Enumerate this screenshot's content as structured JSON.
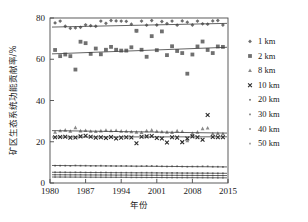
{
  "chart_data": {
    "type": "scatter",
    "title": "",
    "xlabel": "年份",
    "ylabel": "矿区生态系统功能贡献率/%",
    "xlim": [
      1980,
      2015
    ],
    "ylim": [
      0,
      80
    ],
    "grid": false,
    "legend_position": "right",
    "xticks": [
      1980,
      1987,
      1994,
      2001,
      2008,
      2015
    ],
    "yticks": [
      0,
      20,
      40,
      60,
      80
    ],
    "x": [
      1981,
      1982,
      1983,
      1984,
      1985,
      1986,
      1987,
      1988,
      1989,
      1990,
      1991,
      1992,
      1993,
      1994,
      1995,
      1996,
      1997,
      1998,
      1999,
      2000,
      2001,
      2002,
      2003,
      2004,
      2005,
      2006,
      2007,
      2008,
      2009,
      2010,
      2011,
      2012,
      2013,
      2014
    ],
    "series": [
      {
        "name": "1 km",
        "marker": "diamond",
        "color": "#6e6e6e",
        "values": [
          77.6,
          78.5,
          76.0,
          75.0,
          75.2,
          75.5,
          76.7,
          76.3,
          76.0,
          78.5,
          77.4,
          78.8,
          78.6,
          78.5,
          78.4,
          77.0,
          73.8,
          78.5,
          76.5,
          78.8,
          76.6,
          78.3,
          77.3,
          78.5,
          76.5,
          78.6,
          78.0,
          76.6,
          78.5,
          77.2,
          77.0,
          78.6,
          78.8,
          76.6
        ],
        "trend": [
          75.6,
          77.4
        ]
      },
      {
        "name": "2 km",
        "marker": "square",
        "color": "#707070",
        "values": [
          64.5,
          61.5,
          62.3,
          61.5,
          55.0,
          68.5,
          67.8,
          62.6,
          65.2,
          62.4,
          64.6,
          66.0,
          64.6,
          64.2,
          64.2,
          65.8,
          73.8,
          64.6,
          61.2,
          71.2,
          64.4,
          73.5,
          62.0,
          66.3,
          64.0,
          63.0,
          53.0,
          62.3,
          66.2,
          68.6,
          64.5,
          63.0,
          66.2,
          66.0
        ],
        "trend": [
          62.6,
          65.8
        ]
      },
      {
        "name": "8 km",
        "marker": "triangle",
        "color": "#8a8a8a",
        "values": [
          24.6,
          25.3,
          25.6,
          25.0,
          26.8,
          25.2,
          25.4,
          25.0,
          24.9,
          25.2,
          25.5,
          25.3,
          25.4,
          25.1,
          25.0,
          24.8,
          24.6,
          24.4,
          25.3,
          25.6,
          25.0,
          24.8,
          24.6,
          24.5,
          25.2,
          24.9,
          20.5,
          24.0,
          24.6,
          26.3,
          26.6,
          23.8,
          24.0,
          23.8
        ],
        "trend": [
          25.4,
          24.2
        ]
      },
      {
        "name": "10 km",
        "marker": "cross",
        "color": "#2a2a2a",
        "values": [
          22.2,
          22.3,
          22.4,
          22.0,
          22.1,
          22.6,
          22.9,
          22.4,
          22.0,
          22.2,
          21.8,
          22.3,
          21.6,
          22.0,
          22.2,
          22.1,
          19.3,
          22.4,
          22.6,
          22.8,
          21.8,
          21.6,
          19.6,
          22.2,
          22.0,
          19.8,
          21.6,
          22.6,
          22.2,
          21.0,
          33.0,
          22.3,
          22.2,
          22.2
        ],
        "trend": [
          22.3,
          22.4
        ]
      },
      {
        "name": "20 km",
        "marker": "dot",
        "color": "#777777",
        "values": [
          8.4,
          8.4,
          8.4,
          8.3,
          8.5,
          8.4,
          8.4,
          8.3,
          8.3,
          8.4,
          8.3,
          8.3,
          8.2,
          8.3,
          8.3,
          8.2,
          8.1,
          8.2,
          8.3,
          8.3,
          8.2,
          8.1,
          8.0,
          8.1,
          8.1,
          8.0,
          7.9,
          8.0,
          8.0,
          8.1,
          8.1,
          7.9,
          7.9,
          7.8
        ],
        "trend": [
          8.5,
          7.8
        ]
      },
      {
        "name": "30 km",
        "marker": "dot",
        "color": "#808080",
        "values": [
          5.2,
          5.2,
          5.2,
          5.1,
          5.2,
          5.2,
          5.1,
          5.1,
          5.1,
          5.1,
          5.1,
          5.0,
          5.0,
          5.0,
          5.0,
          5.0,
          4.9,
          5.0,
          5.0,
          5.0,
          4.9,
          4.9,
          4.8,
          4.9,
          4.9,
          4.8,
          4.8,
          4.8,
          4.8,
          4.8,
          4.8,
          4.7,
          4.7,
          4.7
        ],
        "trend": [
          5.2,
          4.7
        ]
      },
      {
        "name": "40 km",
        "marker": "dot",
        "color": "#8c8c8c",
        "values": [
          4.0,
          4.0,
          4.0,
          3.9,
          4.0,
          4.0,
          3.9,
          3.9,
          3.9,
          3.9,
          3.9,
          3.9,
          3.8,
          3.9,
          3.9,
          3.8,
          3.8,
          3.8,
          3.8,
          3.8,
          3.8,
          3.7,
          3.7,
          3.7,
          3.7,
          3.7,
          3.6,
          3.7,
          3.7,
          3.7,
          3.6,
          3.6,
          3.6,
          3.6
        ],
        "trend": [
          4.0,
          3.6
        ]
      },
      {
        "name": "50 km",
        "marker": "dot",
        "color": "#9a9a9a",
        "values": [
          2.9,
          2.9,
          2.9,
          2.9,
          2.9,
          2.9,
          2.8,
          2.8,
          2.8,
          2.8,
          2.8,
          2.8,
          2.8,
          2.8,
          2.8,
          2.7,
          2.7,
          2.7,
          2.7,
          2.7,
          2.7,
          2.7,
          2.6,
          2.6,
          2.6,
          2.6,
          2.6,
          2.6,
          2.6,
          2.6,
          2.6,
          2.5,
          2.5,
          2.5
        ],
        "trend": [
          2.9,
          2.5
        ]
      }
    ]
  }
}
